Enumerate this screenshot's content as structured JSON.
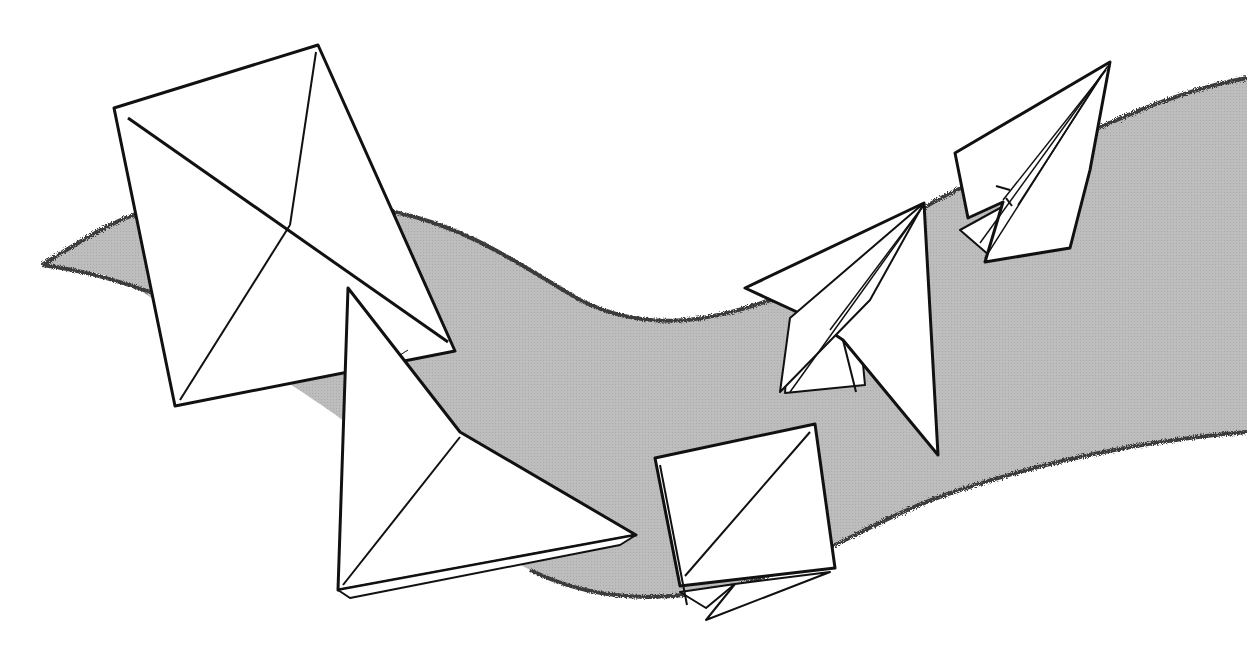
{
  "illustration": {
    "subject": "Origami folding sequence",
    "background_color": "#ffffff",
    "ribbon_color": "#b9b9b9",
    "ribbon_edge_color": "#3a3a3a",
    "paper_fill": "#ffffff",
    "line_color": "#111111",
    "steps": [
      {
        "id": "step-1",
        "shape": "square sheet with diagonal creases"
      },
      {
        "id": "step-2",
        "shape": "large triangle folded"
      },
      {
        "id": "step-3",
        "shape": "small folded square"
      },
      {
        "id": "step-4",
        "shape": "kite / dart fold"
      },
      {
        "id": "step-5",
        "shape": "finished dart fold"
      }
    ]
  }
}
